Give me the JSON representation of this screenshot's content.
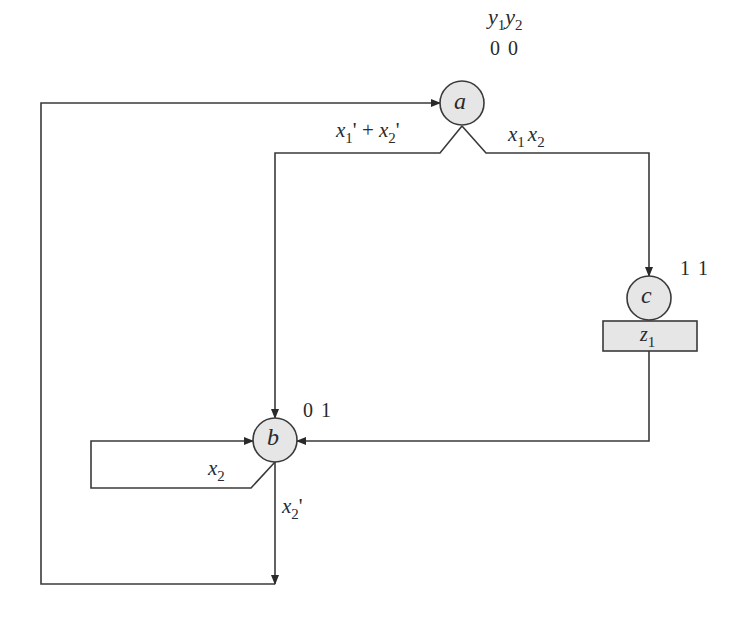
{
  "diagram": {
    "type": "state-diagram",
    "state_variables_header": {
      "v1": "y",
      "v1_sub": "1",
      "v2": "y",
      "v2_sub": "2"
    },
    "colors": {
      "node_fill": "#e6e6e6",
      "stroke": "#3a3a3a",
      "background": "#ffffff"
    },
    "nodes": [
      {
        "id": "a",
        "label": "a",
        "code": "0 0"
      },
      {
        "id": "b",
        "label": "b",
        "code": "0 1"
      },
      {
        "id": "c",
        "label": "c",
        "code": "1 1",
        "output": {
          "var": "z",
          "sub": "1"
        }
      }
    ],
    "edges": [
      {
        "from": "a",
        "to": "b",
        "label": "x1' + x2'",
        "parts": {
          "v1": "x",
          "s1": "1",
          "p1": "'",
          "op": " + ",
          "v2": "x",
          "s2": "2",
          "p2": "'"
        }
      },
      {
        "from": "a",
        "to": "c",
        "label": "x1 x2",
        "parts": {
          "v1": "x",
          "s1": "1",
          "v2": "x",
          "s2": "2"
        }
      },
      {
        "from": "c",
        "to": "b",
        "label": ""
      },
      {
        "from": "b",
        "to": "b",
        "label": "x2",
        "parts": {
          "v1": "x",
          "s1": "2"
        }
      },
      {
        "from": "b",
        "to": "a",
        "label": "x2'",
        "parts": {
          "v1": "x",
          "s1": "2",
          "p1": "'"
        }
      }
    ]
  }
}
